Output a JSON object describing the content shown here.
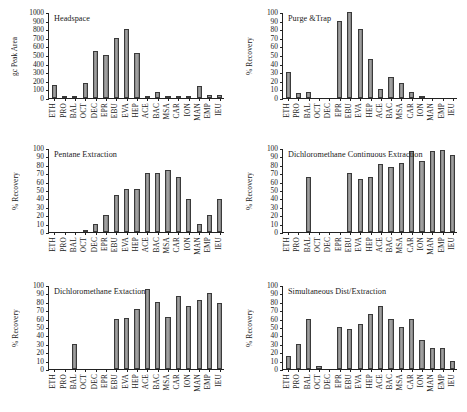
{
  "figure": {
    "categories": [
      "ETH",
      "PRO",
      "BAL",
      "OCT",
      "DEC",
      "EPR",
      "EBU",
      "EVA",
      "HEP",
      "ACE",
      "BAC",
      "MSA",
      "CAR",
      "ION",
      "MAN",
      "EMP",
      "IEU"
    ]
  },
  "chart_data": [
    {
      "type": "bar",
      "title": "Headspace",
      "xlabel": "",
      "ylabel": "gc Peak Area",
      "ylim": [
        0,
        1000
      ],
      "yticks": [
        0,
        100,
        200,
        300,
        400,
        500,
        600,
        700,
        800,
        900,
        1000
      ],
      "grid": false,
      "legend": "none",
      "categories": [
        "ETH",
        "PRO",
        "BAL",
        "OCT",
        "DEC",
        "EPR",
        "EBU",
        "EVA",
        "HEP",
        "ACE",
        "BAC",
        "MSA",
        "CAR",
        "ION",
        "MAN",
        "EMP",
        "IEU"
      ],
      "values": [
        150,
        20,
        25,
        170,
        545,
        500,
        700,
        800,
        525,
        15,
        70,
        12,
        15,
        25,
        145,
        35,
        40
      ]
    },
    {
      "type": "bar",
      "title": "Purge &Trap",
      "xlabel": "",
      "ylabel": "% Recovery",
      "ylim": [
        0,
        100
      ],
      "yticks": [
        0,
        10,
        20,
        30,
        40,
        50,
        60,
        70,
        80,
        90,
        100
      ],
      "grid": false,
      "legend": "none",
      "categories": [
        "ETH",
        "PRO",
        "BAL",
        "OCT",
        "DEC",
        "EPR",
        "EBU",
        "EVA",
        "HEP",
        "ACE",
        "BAC",
        "MSA",
        "CAR",
        "ION",
        "MAN",
        "EMP",
        "IEU"
      ],
      "values": [
        30,
        6,
        7,
        0,
        0,
        90,
        100,
        80,
        45,
        10,
        24,
        18,
        7,
        2,
        0,
        0,
        0
      ]
    },
    {
      "type": "bar",
      "title": "Pentane Extraction",
      "xlabel": "",
      "ylabel": "% Recovery",
      "ylim": [
        0,
        100
      ],
      "yticks": [
        0,
        10,
        20,
        30,
        40,
        50,
        60,
        70,
        80,
        90,
        100
      ],
      "grid": false,
      "legend": "none",
      "categories": [
        "ETH",
        "PRO",
        "BAL",
        "OCT",
        "DEC",
        "EPR",
        "EBU",
        "EVA",
        "HEP",
        "ACE",
        "BAC",
        "MSA",
        "CAR",
        "ION",
        "MAN",
        "EMP",
        "IEU"
      ],
      "values": [
        0,
        0,
        0,
        2,
        10,
        20,
        44,
        51,
        51,
        70,
        70,
        74,
        65,
        39,
        10,
        20,
        39
      ]
    },
    {
      "type": "bar",
      "title": "Dichloromethane Continuous Extraction",
      "xlabel": "",
      "ylabel": "% Recovery",
      "ylim": [
        0,
        100
      ],
      "yticks": [
        0,
        10,
        20,
        30,
        40,
        50,
        60,
        70,
        80,
        90,
        100
      ],
      "grid": false,
      "legend": "none",
      "categories": [
        "ETH",
        "PRO",
        "BAL",
        "OCT",
        "DEC",
        "EPR",
        "EBU",
        "EVA",
        "HEP",
        "ACE",
        "BAC",
        "MSA",
        "CAR",
        "ION",
        "MAN",
        "EMP",
        "IEU"
      ],
      "values": [
        0,
        0,
        66,
        0,
        0,
        0,
        70,
        63,
        66,
        81,
        77,
        82,
        96,
        84,
        97,
        98,
        92
      ]
    },
    {
      "type": "bar",
      "title": "Dichloromethane Extaction",
      "xlabel": "",
      "ylabel": "% Recovery",
      "ylim": [
        0,
        100
      ],
      "yticks": [
        0,
        10,
        20,
        30,
        40,
        50,
        60,
        70,
        80,
        90,
        100
      ],
      "grid": false,
      "legend": "none",
      "categories": [
        "ETH",
        "PRO",
        "BAL",
        "OCT",
        "DEC",
        "EPR",
        "EBU",
        "EVA",
        "HEP",
        "ACE",
        "BAC",
        "MSA",
        "CAR",
        "ION",
        "MAN",
        "EMP",
        "IEU"
      ],
      "values": [
        0,
        0,
        30,
        0,
        0,
        0,
        60,
        61,
        71,
        95,
        80,
        62,
        87,
        75,
        82,
        90,
        79
      ]
    },
    {
      "type": "bar",
      "title": "Simultaneous Dist/Extraction",
      "xlabel": "",
      "ylabel": "% Recovery",
      "ylim": [
        0,
        100
      ],
      "yticks": [
        0,
        10,
        20,
        30,
        40,
        50,
        60,
        70,
        80,
        90,
        100
      ],
      "grid": false,
      "legend": "none",
      "categories": [
        "ETH",
        "PRO",
        "BAL",
        "OCT",
        "DEC",
        "EPR",
        "EBU",
        "EVA",
        "HEP",
        "ACE",
        "BAC",
        "MSA",
        "CAR",
        "ION",
        "MAN",
        "EMP",
        "IEU"
      ],
      "values": [
        15,
        30,
        60,
        3,
        0,
        50,
        48,
        54,
        65,
        75,
        60,
        50,
        60,
        34,
        25,
        25,
        10
      ]
    }
  ]
}
